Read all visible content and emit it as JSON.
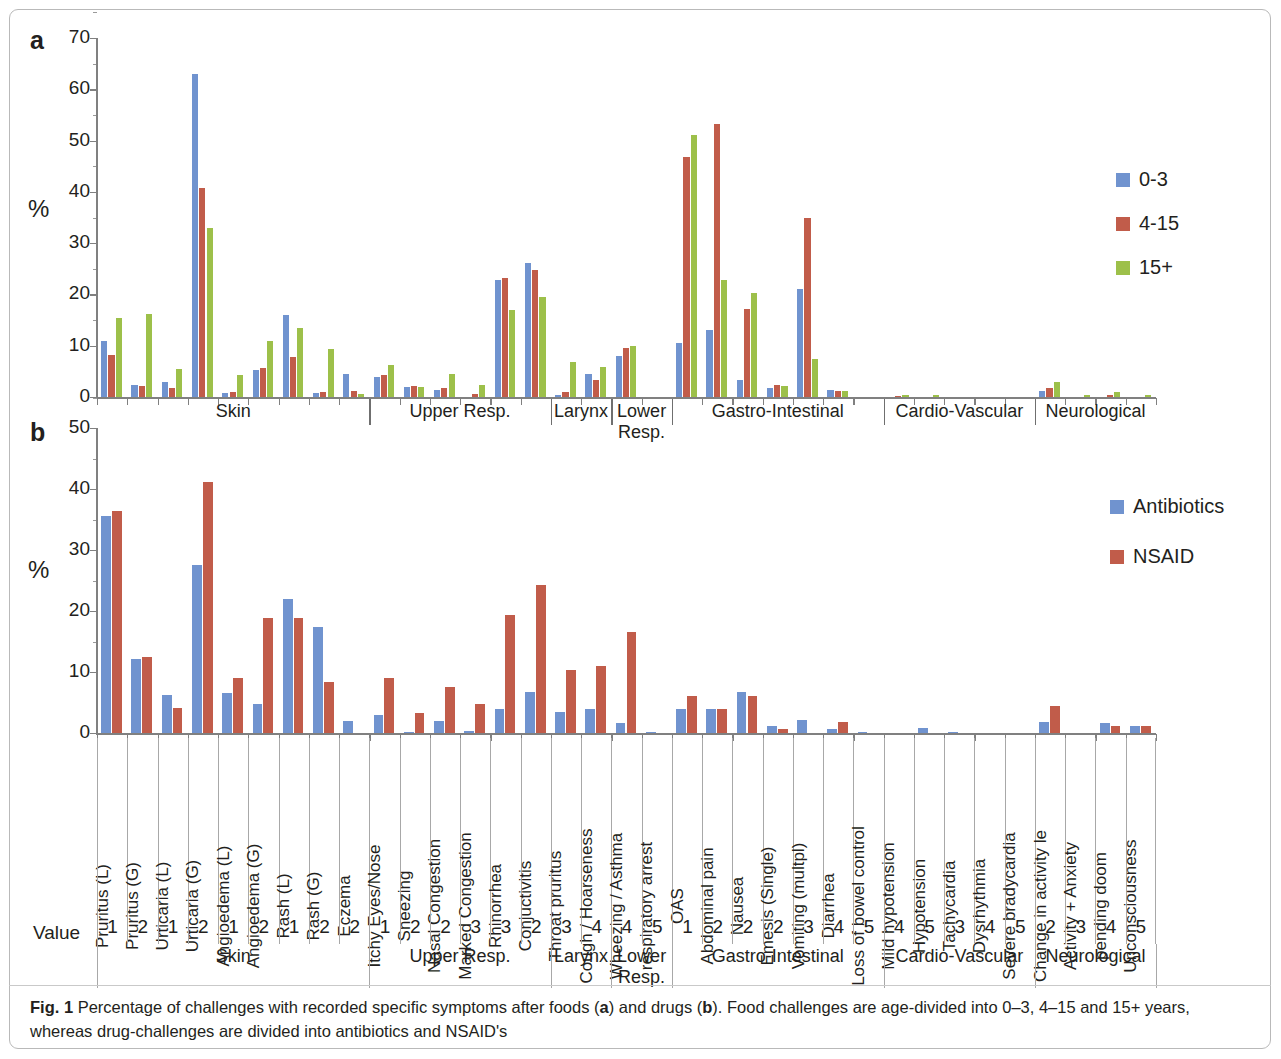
{
  "figure": {
    "caption_label": "Fig. 1",
    "caption_text_1": "Percentage of challenges with recorded specific symptoms after foods (",
    "caption_a": "a",
    "caption_text_2": ") and drugs (",
    "caption_b": "b",
    "caption_text_3": "). Food challenges are age-divided into 0–3, 4–15 and 15+ years, whereas drug-challenges are divided into antibiotics and NSAID's"
  },
  "panel_a": {
    "letter": "a",
    "ylabel": "%"
  },
  "panel_b": {
    "letter": "b",
    "ylabel": "%"
  },
  "axis": {
    "value_row_label": "Value",
    "a_ticks": [
      "70",
      "60",
      "50",
      "40",
      "30",
      "20",
      "10",
      "0"
    ],
    "b_ticks": [
      "50",
      "40",
      "30",
      "20",
      "10",
      "0"
    ]
  },
  "categories": [
    "Pruritus (L)",
    "Pruritus (G)",
    "Urticaria (L)",
    "Urticaria (G)",
    "Angioedema (L)",
    "Angioedema (G)",
    "Rash (L)",
    "Rash (G)",
    "Eczema",
    "Itchy Eyes/Nose",
    "Sneezing",
    "Nasal Congestion",
    "Marked Congestion",
    "Rhinorrhea",
    "Conjuctivitis",
    "Throat pruritus",
    "Cough / Hoarseness",
    "Wheezing / Asthma",
    "respiratory arrest",
    "OAS",
    "Abdominal pain",
    "Nausea",
    "Emesis (Single)",
    "Vomiting (multpl)",
    "Diarrhea",
    "Loss of bowel control",
    "Mild hypotension",
    "Hypotension",
    "Tachycardia",
    "Dysrhythmia",
    "Severe bradycardia",
    "Change in activity le",
    "Activity + Anxiety",
    "pending doom",
    "Unconsciousness"
  ],
  "values": [
    "1",
    "2",
    "1",
    "2",
    "1",
    "2",
    "1",
    "2",
    "2",
    "1",
    "2",
    "2",
    "3",
    "3",
    "2",
    "3",
    "4",
    "4",
    "5",
    "1",
    "2",
    "2",
    "2",
    "3",
    "4",
    "5",
    "4",
    "5",
    "3",
    "4",
    "5",
    "2",
    "3",
    "4",
    "5"
  ],
  "bands": [
    {
      "label": "Skin",
      "start": 0,
      "count": 9
    },
    {
      "label": "Upper Resp.",
      "start": 9,
      "count": 6
    },
    {
      "label": "Larynx",
      "start": 15,
      "count": 2
    },
    {
      "label": "Lower Resp.",
      "start": 17,
      "count": 2
    },
    {
      "label": "Gastro-Intestinal",
      "start": 19,
      "count": 7
    },
    {
      "label": "Cardio-Vascular",
      "start": 26,
      "count": 5
    },
    {
      "label": "Neurological",
      "start": 31,
      "count": 4
    }
  ],
  "colors": {
    "series_blue": "#7093cf",
    "series_red": "#c15c4a",
    "series_green": "#9dc04a",
    "axis": "#808080",
    "grid": "#a8a8a8"
  },
  "chart_data": [
    {
      "type": "bar",
      "panel": "a",
      "title": "Percentage of challenges with recorded specific symptoms after foods",
      "xlabel": "",
      "ylabel": "%",
      "ylim": [
        0,
        70
      ],
      "yticks": [
        0,
        10,
        20,
        30,
        40,
        50,
        60,
        70
      ],
      "grid": false,
      "legend_position": "right",
      "categories": [
        "Pruritus (L)",
        "Pruritus (G)",
        "Urticaria (L)",
        "Urticaria (G)",
        "Angioedema (L)",
        "Angioedema (G)",
        "Rash (L)",
        "Rash (G)",
        "Eczema",
        "Itchy Eyes/Nose",
        "Sneezing",
        "Nasal Congestion",
        "Marked Congestion",
        "Rhinorrhea",
        "Conjuctivitis",
        "Throat pruritus",
        "Cough / Hoarseness",
        "Wheezing / Asthma",
        "respiratory arrest",
        "OAS",
        "Abdominal pain",
        "Nausea",
        "Emesis (Single)",
        "Vomiting (multpl)",
        "Diarrhea",
        "Loss of bowel control",
        "Mild hypotension",
        "Hypotension",
        "Tachycardia",
        "Dysrhythmia",
        "Severe bradycardia",
        "Change in activity le",
        "Activity + Anxiety",
        "pending doom",
        "Unconsciousness"
      ],
      "series": [
        {
          "name": "0-3",
          "color": "#7093cf",
          "values": [
            11.0,
            2.4,
            2.9,
            63.0,
            0.7,
            5.3,
            15.9,
            0.7,
            4.5,
            4.0,
            1.9,
            1.4,
            0.0,
            22.8,
            26.2,
            0.3,
            4.5,
            8.0,
            0.0,
            10.6,
            13.0,
            3.4,
            1.7,
            21.0,
            1.4,
            0.0,
            0.0,
            0.0,
            0.0,
            0.0,
            0.0,
            1.2,
            0.0,
            0.0,
            0.0
          ]
        },
        {
          "name": "4-15",
          "color": "#c15c4a",
          "values": [
            8.2,
            2.1,
            1.8,
            40.8,
            0.9,
            5.6,
            7.8,
            1.0,
            1.2,
            4.2,
            2.2,
            1.8,
            0.5,
            23.3,
            24.8,
            0.9,
            3.3,
            9.6,
            0.0,
            46.8,
            53.2,
            17.1,
            2.4,
            35.0,
            1.2,
            0.0,
            0.2,
            0.0,
            0.0,
            0.0,
            0.0,
            1.7,
            0.0,
            0.3,
            0.0
          ]
        },
        {
          "name": "15+",
          "color": "#9dc04a",
          "values": [
            15.5,
            16.2,
            5.4,
            32.9,
            4.3,
            10.9,
            13.5,
            9.3,
            0.5,
            6.2,
            1.9,
            4.4,
            2.4,
            17.0,
            19.5,
            6.8,
            5.9,
            10.0,
            0.0,
            51.0,
            22.8,
            20.3,
            2.2,
            7.5,
            1.2,
            0.0,
            0.3,
            0.3,
            0.0,
            0.0,
            0.0,
            3.0,
            0.4,
            1.0,
            0.4
          ]
        }
      ]
    },
    {
      "type": "bar",
      "panel": "b",
      "title": "Percentage of challenges with recorded specific symptoms after drugs",
      "xlabel": "",
      "ylabel": "%",
      "ylim": [
        0,
        50
      ],
      "yticks": [
        0,
        10,
        20,
        30,
        40,
        50
      ],
      "grid": false,
      "legend_position": "right",
      "categories": [
        "Pruritus (L)",
        "Pruritus (G)",
        "Urticaria (L)",
        "Urticaria (G)",
        "Angioedema (L)",
        "Angioedema (G)",
        "Rash (L)",
        "Rash (G)",
        "Eczema",
        "Itchy Eyes/Nose",
        "Sneezing",
        "Nasal Congestion",
        "Marked Congestion",
        "Rhinorrhea",
        "Conjuctivitis",
        "Throat pruritus",
        "Cough / Hoarseness",
        "Wheezing / Asthma",
        "respiratory arrest",
        "OAS",
        "Abdominal pain",
        "Nausea",
        "Emesis (Single)",
        "Vomiting (multpl)",
        "Diarrhea",
        "Loss of bowel control",
        "Mild hypotension",
        "Hypotension",
        "Tachycardia",
        "Dysrhythmia",
        "Severe bradycardia",
        "Change in activity le",
        "Activity + Anxiety",
        "pending doom",
        "Unconsciousness"
      ],
      "series": [
        {
          "name": "Antibiotics",
          "color": "#7093cf",
          "values": [
            35.5,
            12.1,
            6.2,
            27.6,
            6.6,
            4.8,
            21.9,
            17.3,
            2.0,
            3.0,
            0.2,
            2.0,
            0.4,
            4.0,
            6.8,
            3.5,
            4.0,
            1.6,
            0.2,
            4.0,
            4.0,
            6.7,
            1.2,
            2.2,
            0.6,
            0.2,
            0.0,
            0.8,
            0.1,
            0.0,
            0.0,
            1.8,
            0.0,
            1.7,
            1.1
          ]
        },
        {
          "name": "NSAID",
          "color": "#c15c4a",
          "values": [
            36.4,
            12.4,
            4.1,
            41.2,
            9.1,
            18.9,
            18.9,
            8.3,
            0.0,
            9.0,
            3.3,
            7.5,
            4.7,
            19.4,
            24.2,
            10.3,
            11.0,
            16.5,
            0.0,
            6.0,
            4.0,
            6.0,
            0.7,
            0.0,
            1.8,
            0.0,
            0.0,
            0.0,
            0.0,
            0.0,
            0.0,
            4.5,
            0.0,
            1.1,
            1.1
          ]
        }
      ]
    }
  ],
  "legend_a": [
    {
      "label": "0-3",
      "color": "#7093cf"
    },
    {
      "label": "4-15",
      "color": "#c15c4a"
    },
    {
      "label": "15+",
      "color": "#9dc04a"
    }
  ],
  "legend_b": [
    {
      "label": "Antibiotics",
      "color": "#7093cf"
    },
    {
      "label": "NSAID",
      "color": "#c15c4a"
    }
  ]
}
